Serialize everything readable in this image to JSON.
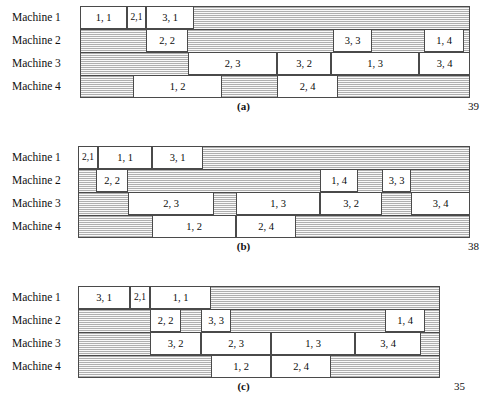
{
  "figure_type": "gantt-schedule-diagram",
  "machine_labels": [
    "Machine 1",
    "Machine 2",
    "Machine 3",
    "Machine 4"
  ],
  "chart_data": {
    "type": "bar",
    "xlabel": "Time",
    "ylabel": "Machine",
    "grid": false,
    "legend": "none",
    "orientation": "horizontal",
    "note": "Each block is labelled 'job, operation'. Track start/end are pixel-derived time units along a common horizontal time axis.",
    "charts": [
      {
        "panel": "(a)",
        "makespan": 39,
        "track_start": 80,
        "track_end": 470,
        "categories": [
          "Machine 1",
          "Machine 2",
          "Machine 3",
          "Machine 4"
        ],
        "series": [
          {
            "name": "Machine 1",
            "tasks": [
              {
                "label": "1, 1",
                "start": 80,
                "end": 127
              },
              {
                "label": "2,1",
                "start": 127,
                "end": 146
              },
              {
                "label": "3, 1",
                "start": 146,
                "end": 194
              }
            ]
          },
          {
            "name": "Machine 2",
            "tasks": [
              {
                "label": "2, 2",
                "start": 146,
                "end": 188
              },
              {
                "label": "3, 3",
                "start": 333,
                "end": 372
              },
              {
                "label": "1, 4",
                "start": 424,
                "end": 464
              }
            ]
          },
          {
            "name": "Machine 3",
            "tasks": [
              {
                "label": "2, 3",
                "start": 188,
                "end": 277
              },
              {
                "label": "3, 2",
                "start": 277,
                "end": 331
              },
              {
                "label": "1, 3",
                "start": 331,
                "end": 419
              },
              {
                "label": "3, 4",
                "start": 419,
                "end": 470
              }
            ]
          },
          {
            "name": "Machine 4",
            "tasks": [
              {
                "label": "1, 2",
                "start": 133,
                "end": 222
              },
              {
                "label": "2, 4",
                "start": 277,
                "end": 338
              }
            ]
          }
        ]
      },
      {
        "panel": "(b)",
        "makespan": 38,
        "track_start": 78,
        "track_end": 470,
        "categories": [
          "Machine 1",
          "Machine 2",
          "Machine 3",
          "Machine 4"
        ],
        "series": [
          {
            "name": "Machine 1",
            "tasks": [
              {
                "label": "2,1",
                "start": 78,
                "end": 98
              },
              {
                "label": "1, 1",
                "start": 98,
                "end": 152
              },
              {
                "label": "3, 1",
                "start": 152,
                "end": 203
              }
            ]
          },
          {
            "name": "Machine 2",
            "tasks": [
              {
                "label": "2, 2",
                "start": 96,
                "end": 128
              },
              {
                "label": "1, 4",
                "start": 320,
                "end": 358
              },
              {
                "label": "3, 3",
                "start": 382,
                "end": 411
              }
            ]
          },
          {
            "name": "Machine 3",
            "tasks": [
              {
                "label": "2, 3",
                "start": 128,
                "end": 214
              },
              {
                "label": "1, 3",
                "start": 236,
                "end": 320
              },
              {
                "label": "3, 2",
                "start": 320,
                "end": 382
              },
              {
                "label": "3, 4",
                "start": 411,
                "end": 470
              }
            ]
          },
          {
            "name": "Machine 4",
            "tasks": [
              {
                "label": "1, 2",
                "start": 152,
                "end": 236
              },
              {
                "label": "2, 4",
                "start": 236,
                "end": 296
              }
            ]
          }
        ]
      },
      {
        "panel": "(c)",
        "makespan": 35,
        "track_start": 78,
        "track_end": 440,
        "categories": [
          "Machine 1",
          "Machine 2",
          "Machine 3",
          "Machine 4"
        ],
        "series": [
          {
            "name": "Machine 1",
            "tasks": [
              {
                "label": "3, 1",
                "start": 78,
                "end": 130
              },
              {
                "label": "2,1",
                "start": 130,
                "end": 150
              },
              {
                "label": "1, 1",
                "start": 150,
                "end": 211
              }
            ]
          },
          {
            "name": "Machine 2",
            "tasks": [
              {
                "label": "2, 2",
                "start": 150,
                "end": 181
              },
              {
                "label": "3, 3",
                "start": 201,
                "end": 231
              },
              {
                "label": "1, 4",
                "start": 385,
                "end": 425
              }
            ]
          },
          {
            "name": "Machine 3",
            "tasks": [
              {
                "label": "3, 2",
                "start": 150,
                "end": 201
              },
              {
                "label": "2, 3",
                "start": 201,
                "end": 271
              },
              {
                "label": "1, 3",
                "start": 271,
                "end": 355
              },
              {
                "label": "3, 4",
                "start": 355,
                "end": 421
              }
            ]
          },
          {
            "name": "Machine 4",
            "tasks": [
              {
                "label": "1, 2",
                "start": 211,
                "end": 271
              },
              {
                "label": "2, 4",
                "start": 271,
                "end": 331
              }
            ]
          }
        ]
      }
    ]
  },
  "panels": [
    {
      "caption": "(a)",
      "makespan_label": "39",
      "top": 6,
      "makespan_right": 8
    },
    {
      "caption": "(b)",
      "makespan_label": "38",
      "top": 146,
      "makespan_right": 8
    },
    {
      "caption": "(c)",
      "makespan_label": "35",
      "top": 286,
      "makespan_right": 22
    }
  ]
}
